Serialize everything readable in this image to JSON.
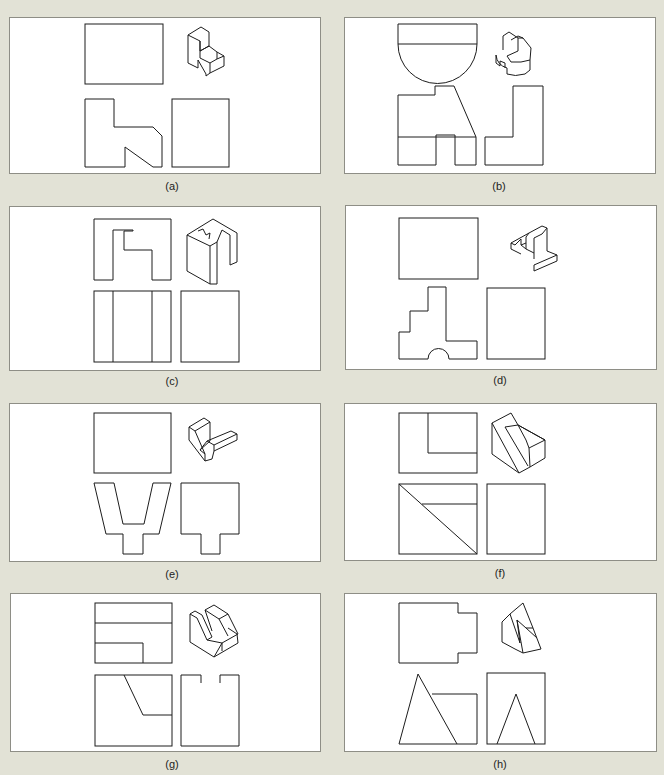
{
  "figure": {
    "panels": [
      {
        "id": "a",
        "label": "(a)"
      },
      {
        "id": "b",
        "label": "(b)"
      },
      {
        "id": "c",
        "label": "(c)"
      },
      {
        "id": "d",
        "label": "(d)"
      },
      {
        "id": "e",
        "label": "(e)"
      },
      {
        "id": "f",
        "label": "(f)"
      },
      {
        "id": "g",
        "label": "(g)"
      },
      {
        "id": "h",
        "label": "(h)"
      }
    ],
    "views_per_panel": [
      "top-view",
      "isometric-view",
      "front-view",
      "side-view"
    ],
    "colors": {
      "page_background": "#e2e2d6",
      "panel_background": "#ffffff",
      "line": "#1c1c1c",
      "panel_border": "#8e8e86"
    }
  }
}
